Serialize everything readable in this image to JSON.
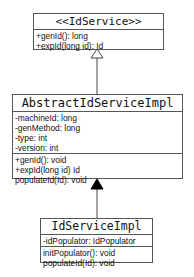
{
  "diagram": {
    "type": "uml-class-diagram",
    "classes": [
      {
        "name": "<<IdService>>",
        "attributes": [],
        "methods": [
          "+genId(): long",
          "+expId(long id): Id"
        ]
      },
      {
        "name": "AbstractIdServiceImpl",
        "attributes": [
          "-machineId: long",
          "-genMethod: long",
          "-type: int",
          "-version: int"
        ],
        "methods": [
          "+genId(): void",
          "+expId(long id) Id",
          "populateId(Id): void"
        ]
      },
      {
        "name": "IdServiceImpl",
        "attributes": [
          "-idPopulator: IdPopulator"
        ],
        "methods": [
          "initPopulator(): void",
          "populateId(Id): void"
        ]
      }
    ],
    "relations": [
      {
        "from": "AbstractIdServiceImpl",
        "to": "<<IdService>>",
        "kind": "realization",
        "arrow": "hollow-triangle"
      },
      {
        "from": "IdServiceImpl",
        "to": "AbstractIdServiceImpl",
        "kind": "inheritance",
        "arrow": "filled-triangle"
      }
    ],
    "colors": {
      "line": "#555555",
      "background": "#ffffff",
      "text": "#111111"
    }
  }
}
